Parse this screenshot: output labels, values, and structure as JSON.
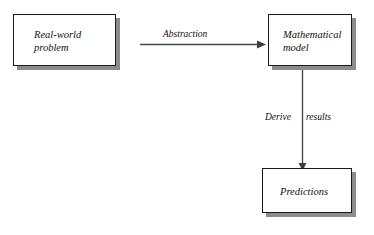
{
  "diagram": {
    "type": "flow-diagram",
    "background_color": "#ffffff",
    "box_border_color": "#1a1a1a",
    "box_fill_color": "#ffffff",
    "shadow_color": "#8c8c8c",
    "arrow_color": "#4a4a4a",
    "text_color": "#111111",
    "nodes": [
      {
        "id": "real-world-problem",
        "label": "Real-world\nproblem"
      },
      {
        "id": "mathematical-model",
        "label": "Mathematical\nmodel"
      },
      {
        "id": "predictions",
        "label": "Predictions"
      }
    ],
    "edges": [
      {
        "id": "abstraction",
        "from": "real-world-problem",
        "to": "mathematical-model",
        "label": "Abstraction",
        "direction": "right"
      },
      {
        "id": "derive-results",
        "from": "mathematical-model",
        "to": "predictions",
        "label": "Derive  results",
        "label_part_1": "Derive",
        "label_part_2": "results",
        "direction": "down"
      }
    ]
  }
}
